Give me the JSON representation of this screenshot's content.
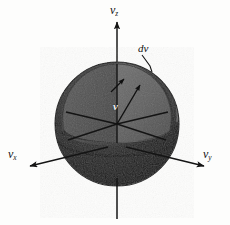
{
  "figure": {
    "type": "physics-diagram",
    "background_color": "#fdfdfc",
    "width": 230,
    "height": 225
  },
  "axes": {
    "z": {
      "label_v": "v",
      "label_sub": "z",
      "name": "vertical-axis",
      "direction": "up"
    },
    "x": {
      "label_v": "v",
      "label_sub": "x",
      "name": "left-axis",
      "direction": "down-left"
    },
    "y": {
      "label_v": "v",
      "label_sub": "y",
      "name": "right-axis",
      "direction": "down-right"
    }
  },
  "annotations": {
    "shell_thickness": {
      "text": "dv",
      "name": "shell-thickness-label"
    },
    "radius_vector": {
      "text": "v",
      "name": "velocity-vector-label"
    }
  },
  "colors": {
    "sphere_outer_dark": "#191919",
    "sphere_outer_mid": "#2e2e2e",
    "shell_band": "#3a3a3a",
    "cut_face": "#656565",
    "cut_face_dark": "#4a4a4a",
    "axis_line": "#1a1a1a",
    "label_text": "#111111",
    "vector_label_text": "#f2f2f2"
  },
  "geometry": {
    "origin_x": 117,
    "origin_y": 124,
    "sphere_radius": 62,
    "shell_inner_radius": 55
  }
}
